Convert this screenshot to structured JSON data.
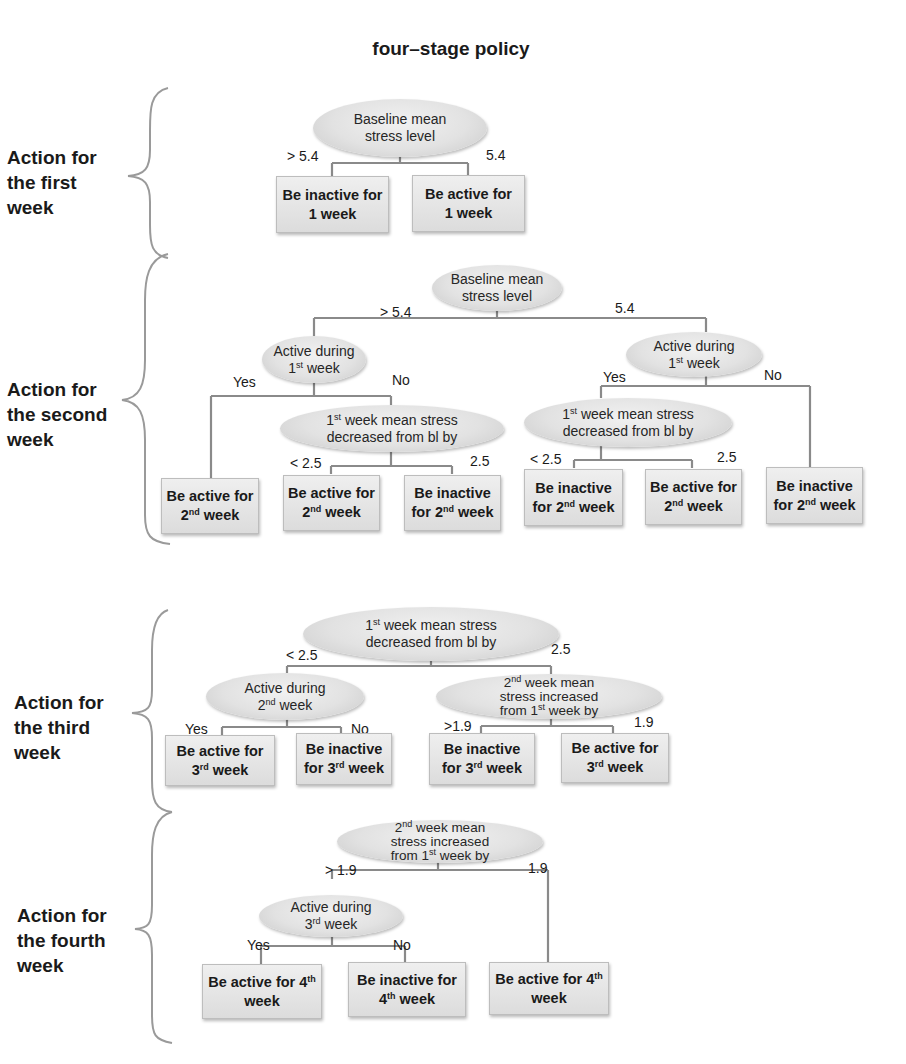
{
  "title": "four–stage policy",
  "colors": {
    "line": "#8a8a8a",
    "node_fill": "#e2e2e2",
    "text": "#1a1a1a",
    "brace": "#9a9a9a"
  },
  "stages": [
    {
      "label": [
        "Action for",
        "the first",
        "week"
      ],
      "root": {
        "text": [
          "Baseline mean",
          "stress level"
        ]
      },
      "branches": [
        {
          "edge": "> 5.4",
          "leaf": "Be inactive for 1 week"
        },
        {
          "edge": "5.4",
          "leaf": "Be active for 1 week"
        }
      ]
    },
    {
      "label": [
        "Action for",
        "the second",
        "week"
      ],
      "root": {
        "text": [
          "Baseline mean",
          "stress level"
        ]
      },
      "branches": [
        {
          "edge": "> 5.4",
          "node": "Active during 1st week",
          "branches": [
            {
              "edge": "Yes",
              "leaf": "Be active for 2nd week"
            },
            {
              "edge": "No",
              "node": "1st week mean stress decreased from bl by",
              "branches": [
                {
                  "edge": "< 2.5",
                  "leaf": "Be active for 2nd week"
                },
                {
                  "edge": "2.5",
                  "leaf": "Be inactive for 2nd week"
                }
              ]
            }
          ]
        },
        {
          "edge": "5.4",
          "node": "Active during 1st week",
          "branches": [
            {
              "edge": "Yes",
              "node": "1st week mean stress decreased from bl by",
              "branches": [
                {
                  "edge": "< 2.5",
                  "leaf": "Be inactive for 2nd week"
                },
                {
                  "edge": "2.5",
                  "leaf": "Be active for 2nd week"
                }
              ]
            },
            {
              "edge": "No",
              "leaf": "Be inactive for 2nd week"
            }
          ]
        }
      ]
    },
    {
      "label": [
        "Action for",
        "the third",
        "week"
      ],
      "root": {
        "text": [
          "1st week mean stress",
          "decreased from bl by"
        ]
      },
      "branches": [
        {
          "edge": "< 2.5",
          "node": "Active during 2nd week",
          "branches": [
            {
              "edge": "Yes",
              "leaf": "Be active for 3rd week"
            },
            {
              "edge": "No",
              "leaf": "Be inactive for 3rd week"
            }
          ]
        },
        {
          "edge": "2.5",
          "node": "2nd week mean stress increased from 1st week by",
          "branches": [
            {
              "edge": ">1.9",
              "leaf": "Be inactive for 3rd week"
            },
            {
              "edge": "1.9",
              "leaf": "Be active for 3rd week"
            }
          ]
        }
      ]
    },
    {
      "label": [
        "Action for",
        "the fourth",
        "week"
      ],
      "root": {
        "text": [
          "2nd week mean",
          "stress increased",
          "from 1st week by"
        ]
      },
      "branches": [
        {
          "edge": "> 1.9",
          "node": "Active during 3rd week",
          "branches": [
            {
              "edge": "Yes",
              "leaf": "Be active for 4th week"
            },
            {
              "edge": "No",
              "leaf": "Be inactive for 4th week"
            }
          ]
        },
        {
          "edge": "1.9",
          "leaf": "Be active for 4th week"
        }
      ]
    }
  ],
  "display": {
    "s1": {
      "label": [
        "Action for",
        "the first",
        "week"
      ],
      "root": [
        "Baseline mean",
        "stress level"
      ],
      "edge_l": "> 5.4",
      "edge_r": "5.4",
      "leaf_l": [
        "Be inactive for",
        "1 week"
      ],
      "leaf_r": [
        "Be active for",
        "1 week"
      ]
    },
    "s2": {
      "label": [
        "Action for",
        "the second",
        "week"
      ],
      "root": [
        "Baseline mean",
        "stress level"
      ],
      "edge_l": "> 5.4",
      "edge_r": "5.4",
      "nodeL": {
        "a": "Active during",
        "n": "1",
        "sup": "st",
        "b": " week"
      },
      "nodeR": {
        "a": "Active during",
        "n": "1",
        "sup": "st",
        "b": " week"
      },
      "yesL": "Yes",
      "noL": "No",
      "yesR": "Yes",
      "noR": "No",
      "decL": {
        "n": "1",
        "sup": "st",
        "a": " week mean stress",
        "b": "decreased from bl by"
      },
      "decR": {
        "n": "1",
        "sup": "st",
        "a": " week mean stress",
        "b": "decreased from bl by"
      },
      "lt1": "< 2.5",
      "ge1": "2.5",
      "lt2": "< 2.5",
      "ge2": "2.5",
      "leaves": [
        {
          "a": "Be active for",
          "n": "2",
          "sup": "nd",
          "b": " week",
          "pre": ""
        },
        {
          "a": "Be active for",
          "n": "2",
          "sup": "nd",
          "b": " week",
          "pre": ""
        },
        {
          "a": "Be inactive",
          "pre": "for ",
          "n": "2",
          "sup": "nd",
          "b": " week"
        },
        {
          "a": "Be inactive",
          "pre": "for ",
          "n": "2",
          "sup": "nd",
          "b": " week"
        },
        {
          "a": "Be active for",
          "n": "2",
          "sup": "nd",
          "b": " week",
          "pre": ""
        },
        {
          "a": "Be inactive",
          "pre": "for ",
          "n": "2",
          "sup": "nd",
          "b": " week"
        }
      ]
    },
    "s3": {
      "label": [
        "Action for",
        "the third",
        "week"
      ],
      "root": {
        "n": "1",
        "sup": "st",
        "a": " week mean stress",
        "b": "decreased from bl by"
      },
      "edge_l": "< 2.5",
      "edge_r": "2.5",
      "nodeL": {
        "a": "Active during",
        "n": "2",
        "sup": "nd",
        "b": " week"
      },
      "nodeR": {
        "n1": "2",
        "sup1": "nd",
        "l1": " week mean",
        "l2": "stress increased",
        "l3a": "from 1",
        "sup2": "st",
        "l3b": " week by"
      },
      "yes": "Yes",
      "no": "No",
      "gt": ">1.9",
      "le": "1.9",
      "leaves": [
        {
          "a": "Be active for",
          "pre": "",
          "n": "3",
          "sup": "rd",
          "b": " week"
        },
        {
          "a": "Be inactive",
          "pre": "for ",
          "n": "3",
          "sup": "rd",
          "b": " week"
        },
        {
          "a": "Be inactive",
          "pre": "for ",
          "n": "3",
          "sup": "rd",
          "b": " week"
        },
        {
          "a": "Be active for",
          "pre": "",
          "n": "3",
          "sup": "rd",
          "b": " week"
        }
      ]
    },
    "s4": {
      "label": [
        "Action for",
        "the fourth",
        "week"
      ],
      "root": {
        "n1": "2",
        "sup1": "nd",
        "l1": " week mean",
        "l2": "stress increased",
        "l3a": "from 1",
        "sup2": "st",
        "l3b": " week by"
      },
      "edge_l": "> 1.9",
      "edge_r": "1.9",
      "nodeL": {
        "a": "Active during",
        "n": "3",
        "sup": "rd",
        "b": " week"
      },
      "yes": "Yes",
      "no": "No",
      "leaves": [
        {
          "a": "Be active for 4",
          "sup": "th",
          "b": "week"
        },
        {
          "a": "Be inactive for",
          "n": "4",
          "sup": "th",
          "b": " week"
        },
        {
          "a": "Be active for 4",
          "sup": "th",
          "b": "week"
        }
      ]
    }
  }
}
